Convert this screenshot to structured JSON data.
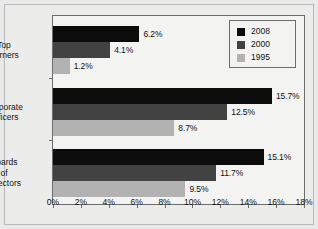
{
  "chart_data": {
    "type": "bar",
    "orientation": "horizontal",
    "title": "",
    "xlabel": "",
    "ylabel": "",
    "categories": [
      "Top\nEarners",
      "Corporate\nOfficers",
      "Boards\nof\nDirectors"
    ],
    "series": [
      {
        "name": "2008",
        "color": "#0c0c0c",
        "values": [
          6.2,
          15.7,
          15.1
        ],
        "labels": [
          "6.2%",
          "15.7%",
          "15.1%"
        ]
      },
      {
        "name": "2000",
        "color": "#424242",
        "values": [
          4.1,
          12.5,
          11.7
        ],
        "labels": [
          "4.1%",
          "12.5%",
          "11.7%"
        ]
      },
      {
        "name": "1995",
        "color": "#b2b2b2",
        "values": [
          1.2,
          8.7,
          9.5
        ],
        "labels": [
          "1.2%",
          "8.7%",
          "9.5%"
        ]
      }
    ],
    "xlim": [
      0,
      18
    ],
    "xticks": [
      0,
      2,
      4,
      6,
      8,
      10,
      12,
      14,
      16,
      18
    ],
    "xtick_labels": [
      "0%",
      "2%",
      "4%",
      "6%",
      "8%",
      "10%",
      "12%",
      "14%",
      "16%",
      "18%"
    ],
    "grid": false,
    "legend_position": "top-right",
    "legend_entries": [
      "2008",
      "2000",
      "1995"
    ]
  },
  "legend": {
    "items": [
      {
        "label": "2008",
        "color": "#0c0c0c"
      },
      {
        "label": "2000",
        "color": "#424242"
      },
      {
        "label": "1995",
        "color": "#b2b2b2"
      }
    ]
  },
  "axis": {
    "x_labels": [
      "0%",
      "2%",
      "4%",
      "6%",
      "8%",
      "10%",
      "12%",
      "14%",
      "16%",
      "18%"
    ]
  },
  "categories": [
    {
      "label": "Top\nEarners"
    },
    {
      "label": "Corporate\nOfficers"
    },
    {
      "label": "Boards\nof\nDirectors"
    }
  ]
}
